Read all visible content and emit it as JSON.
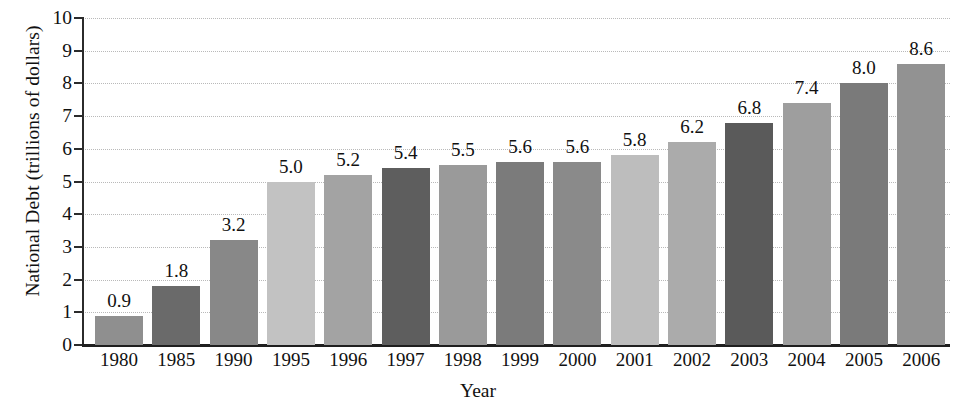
{
  "chart_data": {
    "type": "bar",
    "title": "",
    "xlabel": "Year",
    "ylabel": "National Debt (trillions of dollars)",
    "categories": [
      "1980",
      "1985",
      "1990",
      "1995",
      "1996",
      "1997",
      "1998",
      "1999",
      "2000",
      "2001",
      "2002",
      "2003",
      "2004",
      "2005",
      "2006"
    ],
    "values": [
      0.9,
      1.8,
      3.2,
      5.0,
      5.2,
      5.4,
      5.5,
      5.6,
      5.6,
      5.8,
      6.2,
      6.8,
      7.4,
      8.0,
      8.6
    ],
    "value_labels": [
      "0.9",
      "1.8",
      "3.2",
      "5.0",
      "5.2",
      "5.4",
      "5.5",
      "5.6",
      "5.6",
      "5.8",
      "6.2",
      "6.8",
      "7.4",
      "8.0",
      "8.6"
    ],
    "bar_colors": [
      "#8f8f8f",
      "#6a6a6a",
      "#888888",
      "#c2c2c2",
      "#a3a3a3",
      "#5e5e5e",
      "#9a9a9a",
      "#7b7b7b",
      "#8a8a8a",
      "#bdbdbd",
      "#ababab",
      "#5a5a5a",
      "#9e9e9e",
      "#7a7a7a",
      "#929292"
    ],
    "ylim": [
      0,
      10
    ],
    "y_ticks": [
      "0",
      "1",
      "2",
      "3",
      "4",
      "5",
      "6",
      "7",
      "8",
      "9",
      "10"
    ],
    "grid": true,
    "grid_style": "dotted-horizontal",
    "legend": "none"
  },
  "axis": {
    "y_title": "National Debt (trillions of dollars)",
    "x_title": "Year"
  }
}
